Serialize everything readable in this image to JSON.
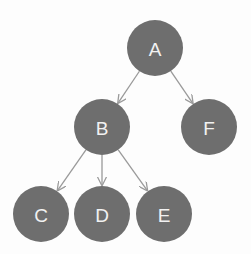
{
  "diagram": {
    "type": "tree",
    "colors": {
      "node_fill": "#6e6e6e",
      "label": "#f2f2f2",
      "edge": "#9a9a9a",
      "background": "#fdfdfd"
    },
    "nodes": [
      {
        "id": "A",
        "label": "A",
        "cx": 155,
        "cy": 48,
        "r": 28
      },
      {
        "id": "B",
        "label": "B",
        "cx": 102,
        "cy": 127,
        "r": 28
      },
      {
        "id": "F",
        "label": "F",
        "cx": 209,
        "cy": 127,
        "r": 28
      },
      {
        "id": "C",
        "label": "C",
        "cx": 41,
        "cy": 214,
        "r": 28
      },
      {
        "id": "D",
        "label": "D",
        "cx": 102,
        "cy": 214,
        "r": 28
      },
      {
        "id": "E",
        "label": "E",
        "cx": 164,
        "cy": 214,
        "r": 28
      }
    ],
    "edges": [
      {
        "from": "A",
        "to": "B"
      },
      {
        "from": "A",
        "to": "F"
      },
      {
        "from": "B",
        "to": "C"
      },
      {
        "from": "B",
        "to": "D"
      },
      {
        "from": "B",
        "to": "E"
      }
    ]
  }
}
